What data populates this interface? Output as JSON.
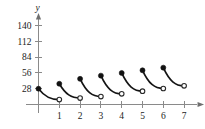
{
  "chart_data": {
    "type": "line",
    "title": "",
    "subtitle": "",
    "xlabel": "t",
    "ylabel": "y",
    "xlim": [
      0,
      7.6
    ],
    "ylim": [
      0,
      152
    ],
    "grid": false,
    "legend": null,
    "x_ticks": [
      1,
      2,
      3,
      4,
      5,
      6,
      7
    ],
    "x_tick_labels": [
      "1",
      "2",
      "3",
      "4",
      "5",
      "6",
      "7"
    ],
    "y_ticks": [
      28,
      56,
      84,
      112,
      140
    ],
    "y_tick_labels": [
      "28",
      "56",
      "84",
      "112",
      "140"
    ],
    "annotations": [],
    "series": [
      {
        "name": "segment-1",
        "x_start": 0,
        "x_end": 1,
        "y_start": 28,
        "y_end": 8.7,
        "start_point": "closed",
        "end_point": "open"
      },
      {
        "name": "segment-2",
        "x_start": 1,
        "x_end": 2,
        "y_start": 36.7,
        "y_end": 11.4,
        "start_point": "closed",
        "end_point": "open"
      },
      {
        "name": "segment-3",
        "x_start": 2,
        "x_end": 3,
        "y_start": 45.4,
        "y_end": 14.1,
        "start_point": "closed",
        "end_point": "open"
      },
      {
        "name": "segment-4",
        "x_start": 3,
        "x_end": 4,
        "y_start": 51.1,
        "y_end": 18.9,
        "start_point": "closed",
        "end_point": "open"
      },
      {
        "name": "segment-5",
        "x_start": 4,
        "x_end": 5,
        "y_start": 55.8,
        "y_end": 23.6,
        "start_point": "closed",
        "end_point": "open"
      },
      {
        "name": "segment-6",
        "x_start": 5,
        "x_end": 6,
        "y_start": 60.5,
        "y_end": 28.3,
        "start_point": "closed",
        "end_point": "open"
      },
      {
        "name": "segment-7",
        "x_start": 6,
        "x_end": 7,
        "y_start": 65.2,
        "y_end": 33.0,
        "start_point": "closed",
        "end_point": "open"
      }
    ]
  }
}
